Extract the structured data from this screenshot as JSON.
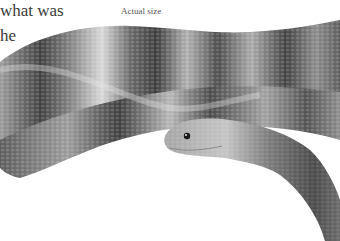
{
  "page": {
    "body_text_lines": [
      "what was",
      "he"
    ],
    "caption": "Actual size"
  },
  "figure": {
    "style": "grayscale photograph on white background"
  }
}
